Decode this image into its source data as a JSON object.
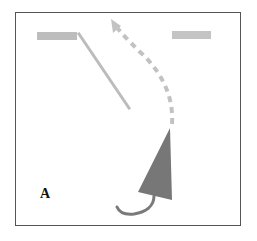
{
  "panel": {
    "label": "A"
  },
  "colors": {
    "frame_border": "#555555",
    "bar_fill": "#bdbdbd",
    "line_stroke": "#bcbcbc",
    "dashed_path_stroke": "#c2c2c2",
    "triangle_fill": "#777777",
    "tail_stroke": "#7a7a7a",
    "label_color": "#111111"
  },
  "elements": {
    "left_bar": {
      "x": 37,
      "y": 32,
      "width": 40,
      "height": 8
    },
    "right_bar": {
      "x": 172,
      "y": 31,
      "width": 39,
      "height": 8
    },
    "diagonal_line": {
      "x1": 79,
      "y1": 34,
      "x2": 129,
      "y2": 108
    },
    "dashed_arrow": {
      "from": [
        172,
        124
      ],
      "to": [
        111,
        20
      ]
    },
    "triangle": {
      "points": [
        [
          170,
          128
        ],
        [
          138,
          192
        ],
        [
          172,
          200
        ]
      ]
    },
    "tail": {
      "from": [
        154,
        196
      ],
      "to": [
        117,
        207
      ]
    }
  }
}
